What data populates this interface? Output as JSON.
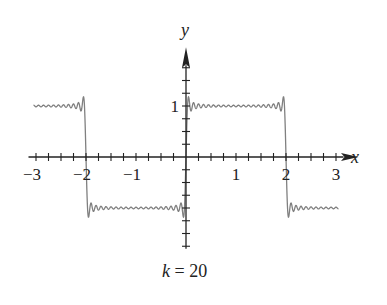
{
  "chart_data": {
    "type": "line",
    "title": "",
    "caption": "k = 20",
    "caption_var": "k",
    "caption_eq": " = 20",
    "xlabel": "x",
    "ylabel": "y",
    "xlim": [
      -3.3,
      3.3
    ],
    "ylim": [
      -2,
      2
    ],
    "x_ticks": [
      -3,
      -2,
      -1,
      1,
      2,
      3
    ],
    "x_tick_labels": [
      "−3",
      "−2",
      "−1",
      "1",
      "2",
      "3"
    ],
    "x_minor_step": 0.25,
    "y_ticks": [
      1
    ],
    "y_tick_labels": [
      "1"
    ],
    "y_minor_step": 0.25,
    "grid": false,
    "legend": null,
    "series": [
      {
        "name": "Fourier partial sum of square wave (k = 20)",
        "function": "(4/pi) * sum_{n=1..k} sin((2n-1)*pi*x/2)/(2n-1)",
        "terms": 20,
        "period": 4,
        "x_range": [
          -3.05,
          3.05
        ],
        "target": "square wave: 1 on (0,2), -1 on (-2,0)",
        "color": "#777777"
      }
    ]
  },
  "layout": {
    "origin_px": [
      186,
      157
    ],
    "x_unit_px": 50,
    "y_unit_px": 51,
    "axis_color": "#222222",
    "curve_color": "#808080"
  }
}
